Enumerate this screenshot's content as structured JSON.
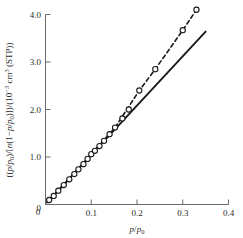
{
  "chart_data": {
    "type": "scatter",
    "title": "",
    "xlabel": "p/p0",
    "xlabel_parts": {
      "numerator": "p",
      "slash": "/",
      "denominator": "p",
      "denominator_sub": "0"
    },
    "ylabel": "((p/p0)/[n(1-p/p0)])/(10^-3 cm^3 (STP))",
    "ylabel_parts": {
      "open": "((",
      "p1": "p",
      "slash1": "/",
      "p2": "p",
      "p2_sub": "0",
      "mid": ")/[",
      "n": "n",
      "paren_open": "(1−",
      "p3": "p",
      "slash2": "/",
      "p4": "p",
      "p4_sub": "0",
      "paren_close": ")])/(10",
      "exp": "−3",
      "units": " cm",
      "units_exp": "3",
      "tail": " (STP))"
    },
    "xlim": [
      0,
      0.4
    ],
    "ylim": [
      0,
      4.0
    ],
    "xticks": [
      "0",
      "0.1",
      "0.2",
      "0.3",
      "0.4"
    ],
    "xtick_values": [
      0,
      0.1,
      0.2,
      0.3,
      0.4
    ],
    "yticks": [
      "0",
      "1.0",
      "2.0",
      "3.0",
      "4.0"
    ],
    "ytick_values": [
      0,
      1.0,
      2.0,
      3.0,
      4.0
    ],
    "grid": false,
    "legend": "none",
    "marker_style": "open-circle",
    "series": [
      {
        "name": "BET data points",
        "style": "open-circle",
        "x": [
          0.008,
          0.018,
          0.028,
          0.04,
          0.052,
          0.063,
          0.072,
          0.083,
          0.092,
          0.1,
          0.108,
          0.118,
          0.128,
          0.14,
          0.152,
          0.168,
          0.182,
          0.205,
          0.24,
          0.3,
          0.33
        ],
        "y": [
          0.095,
          0.18,
          0.29,
          0.41,
          0.53,
          0.64,
          0.74,
          0.85,
          0.96,
          1.06,
          1.13,
          1.23,
          1.34,
          1.48,
          1.62,
          1.81,
          2.0,
          2.4,
          2.85,
          3.67,
          4.1
        ]
      },
      {
        "name": "dashed curve through data",
        "style": "dashed-line",
        "x": [
          0.008,
          0.052,
          0.1,
          0.152,
          0.205,
          0.24,
          0.3,
          0.33
        ],
        "y": [
          0.095,
          0.53,
          1.06,
          1.62,
          2.4,
          2.85,
          3.67,
          4.1
        ]
      },
      {
        "name": "solid BET linear fit",
        "style": "solid-line",
        "x": [
          0.003,
          0.35
        ],
        "y": [
          0.04,
          3.64
        ]
      }
    ],
    "colors": {
      "data_marker_stroke": "#1a1a1a",
      "data_marker_fill": "#ffffff",
      "solid_line": "#1a1a1a",
      "dashed_line": "#1a1a1a",
      "axis": "#6b6b6b",
      "text": "#2a2a2a",
      "background": "#ffffff"
    }
  }
}
